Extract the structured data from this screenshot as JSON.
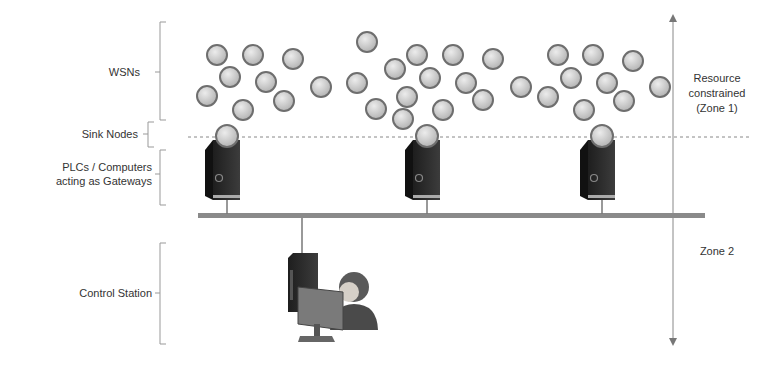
{
  "labels": {
    "wsns": "WSNs",
    "sink_nodes": "Sink Nodes",
    "plcs_line1": "PLCs / Computers",
    "plcs_line2": "acting as Gateways",
    "control_station": "Control Station",
    "zone1_line1": "Resource",
    "zone1_line2": "constrained",
    "zone1_line3": "(Zone 1)",
    "zone2": "Zone 2"
  },
  "colors": {
    "node_fill": "#c8c8c8",
    "node_stroke": "#6e6e6e",
    "tower": "#2a2a2a",
    "bus": "#8a8a8a",
    "text": "#333333"
  },
  "sensor_nodes": [
    [
      217,
      55
    ],
    [
      253,
      55
    ],
    [
      293,
      59
    ],
    [
      230,
      77
    ],
    [
      266,
      82
    ],
    [
      207,
      96
    ],
    [
      284,
      101
    ],
    [
      321,
      87
    ],
    [
      243,
      110
    ],
    [
      367,
      42
    ],
    [
      357,
      83
    ],
    [
      395,
      69
    ],
    [
      417,
      55
    ],
    [
      453,
      55
    ],
    [
      430,
      78
    ],
    [
      466,
      83
    ],
    [
      407,
      97
    ],
    [
      376,
      109
    ],
    [
      403,
      119
    ],
    [
      443,
      110
    ],
    [
      493,
      59
    ],
    [
      483,
      100
    ],
    [
      521,
      87
    ],
    [
      548,
      97
    ],
    [
      558,
      55
    ],
    [
      571,
      78
    ],
    [
      593,
      55
    ],
    [
      607,
      83
    ],
    [
      633,
      61
    ],
    [
      624,
      101
    ],
    [
      584,
      110
    ],
    [
      660,
      87
    ]
  ],
  "gateways": [
    {
      "x": 227,
      "label": "gateway-1"
    },
    {
      "x": 427,
      "label": "gateway-2"
    },
    {
      "x": 602,
      "label": "gateway-3"
    }
  ]
}
